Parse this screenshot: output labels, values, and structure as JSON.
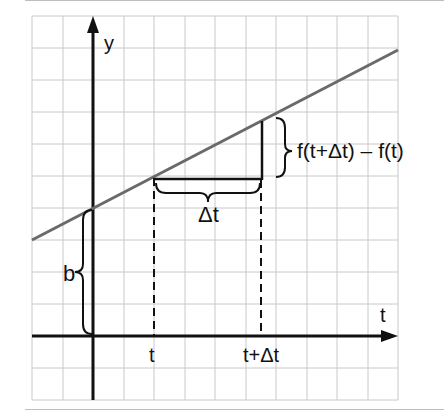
{
  "diagram": {
    "axes": {
      "x_label": "t",
      "y_label": "y"
    },
    "labels": {
      "intercept": "b",
      "t": "t",
      "t_plus_dt": "t+Δt",
      "delta_t": "Δt",
      "delta_f": "f(t+Δt) – f(t)"
    },
    "colors": {
      "grid": "#c8c8c8",
      "axis": "#111111",
      "line": "#6a6a6a",
      "frame_rule": "#bdbdbd"
    }
  }
}
